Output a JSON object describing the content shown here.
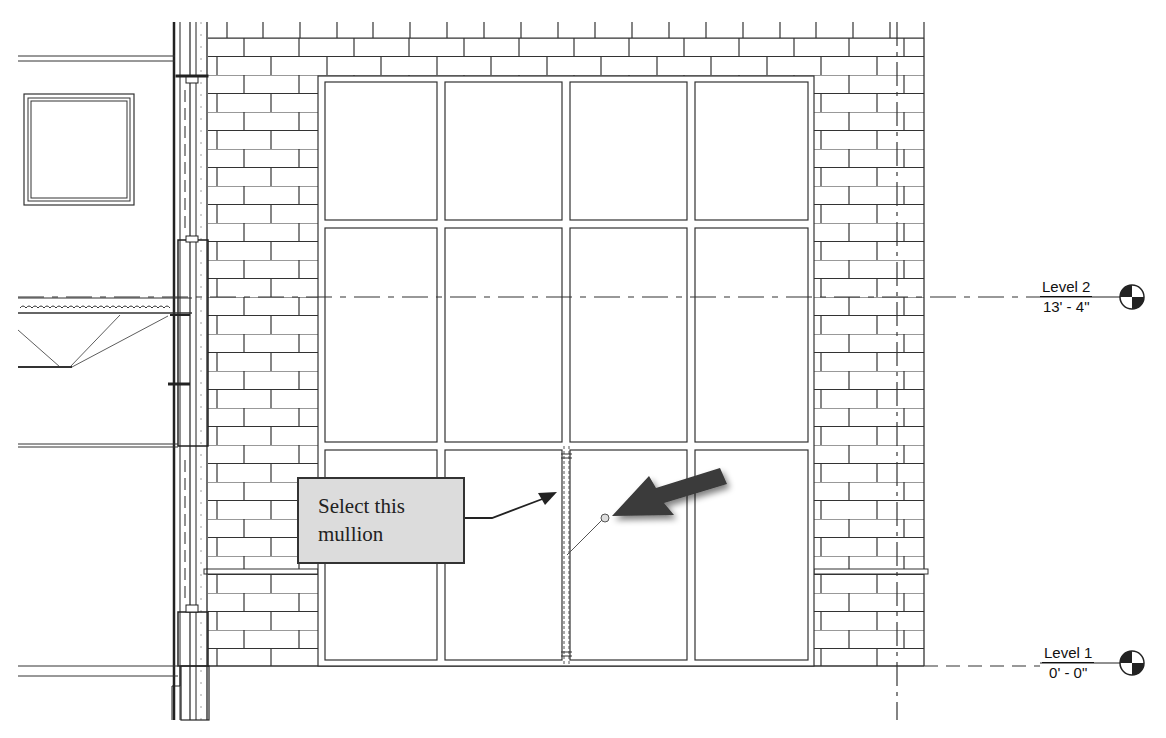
{
  "view": {
    "type": "elevation",
    "background": "#ffffff",
    "line_color": "#2a2a2a"
  },
  "callout": {
    "line1": "Select this",
    "line2": "mullion",
    "fill": "#dcdcdc",
    "border": "#333333"
  },
  "pointer_arrow": {
    "color": "#3a3a3a",
    "direction": "down-left"
  },
  "levels": [
    {
      "name": "Level 2",
      "elevation": "13' - 4\"",
      "y": 297
    },
    {
      "name": "Level 1",
      "elevation": "0' - 0\"",
      "y": 663
    }
  ],
  "curtain_wall": {
    "columns": 4,
    "rows": 3,
    "selected_mullion": "vertical mullion between column 2 and 3, bottom panel"
  }
}
